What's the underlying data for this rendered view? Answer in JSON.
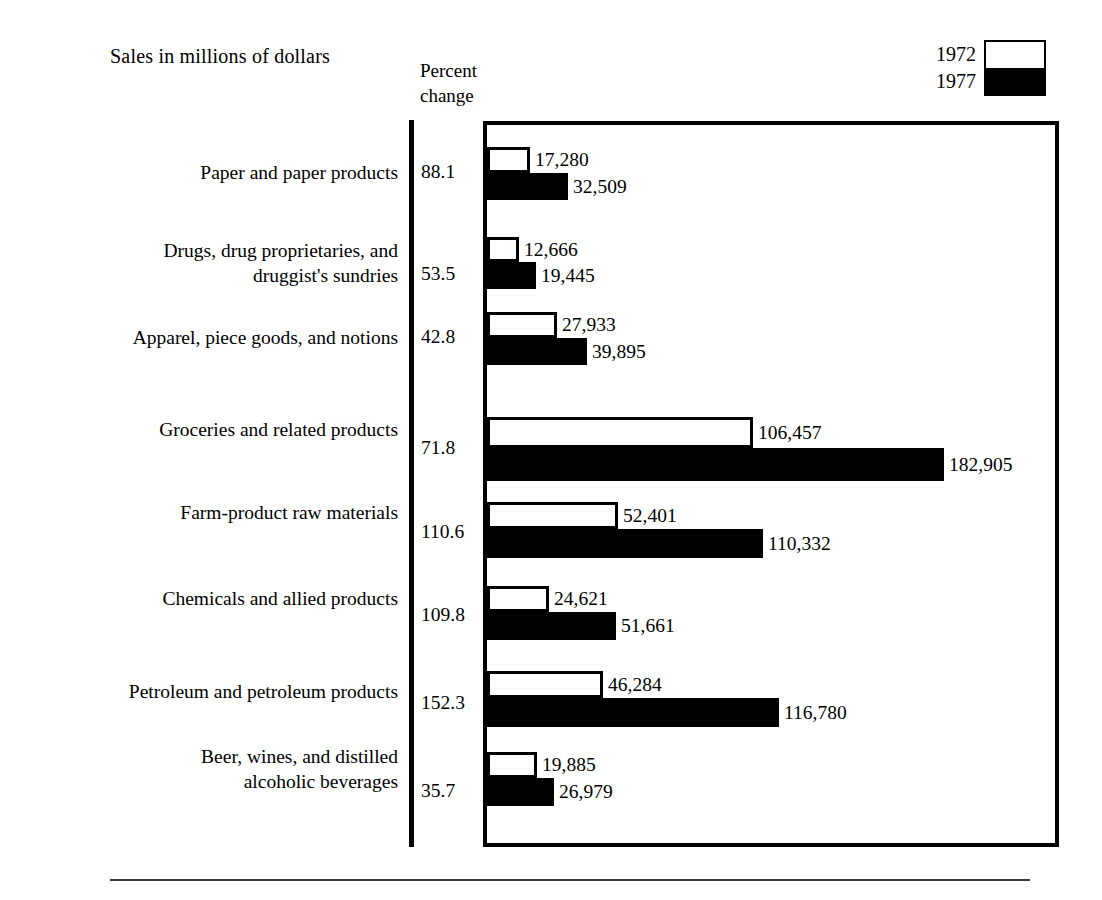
{
  "header": {
    "title": "Sales in millions of dollars",
    "percent_column_header_line1": "Percent",
    "percent_column_header_line2": "change"
  },
  "legend": {
    "position": "top-right",
    "entries": [
      {
        "label": "1972",
        "swatch": "hollow-white-rect",
        "color": "#ffffff"
      },
      {
        "label": "1977",
        "swatch": "solid-black-rect",
        "color": "#000000"
      }
    ]
  },
  "chart_data": {
    "type": "bar",
    "orientation": "horizontal",
    "title": "Sales in millions of dollars",
    "xlabel": "",
    "ylabel": "",
    "grid": false,
    "legend_position": "top-right",
    "axis_max": 182905,
    "xlim": [
      0,
      182905
    ],
    "value_unit": "millions of dollars",
    "categories": [
      "Paper and paper products",
      "Drugs, drug proprietaries, and druggist's sundries",
      "Apparel, piece goods, and notions",
      "Groceries and related products",
      "Farm-product raw materials",
      "Chemicals and allied products",
      "Petroleum and petroleum products",
      "Beer, wines, and distilled alcoholic beverages"
    ],
    "series": [
      {
        "name": "1972",
        "values": [
          17280,
          12666,
          27933,
          106457,
          52401,
          24621,
          46284,
          19885
        ]
      },
      {
        "name": "1977",
        "values": [
          32509,
          19445,
          39895,
          182905,
          110332,
          51661,
          116780,
          26979
        ]
      }
    ],
    "percent_change": [
      88.1,
      53.5,
      42.8,
      71.8,
      110.6,
      109.8,
      152.3,
      35.7
    ]
  },
  "rows": [
    {
      "label": "Paper and paper products",
      "pct": "88.1",
      "v1972": "17,280",
      "v1977": "32,509",
      "n1972": 17280,
      "n1977": 32509
    },
    {
      "label": "Drugs, drug proprietaries, and\ndruggist's sundries",
      "pct": "53.5",
      "v1972": "12,666",
      "v1977": "19,445",
      "n1972": 12666,
      "n1977": 19445
    },
    {
      "label": "Apparel, piece goods, and notions",
      "pct": "42.8",
      "v1972": "27,933",
      "v1977": "39,895",
      "n1972": 27933,
      "n1977": 39895
    },
    {
      "label": "Groceries and related products",
      "pct": "71.8",
      "v1972": "106,457",
      "v1977": "182,905",
      "n1972": 106457,
      "n1977": 182905
    },
    {
      "label": "Farm-product raw materials",
      "pct": "110.6",
      "v1972": "52,401",
      "v1977": "110,332",
      "n1972": 52401,
      "n1977": 110332
    },
    {
      "label": "Chemicals and allied products",
      "pct": "109.8",
      "v1972": "24,621",
      "v1977": "51,661",
      "n1972": 24621,
      "n1977": 51661
    },
    {
      "label": "Petroleum and petroleum products",
      "pct": "152.3",
      "v1972": "46,284",
      "v1977": "116,780",
      "n1972": 46284,
      "n1977": 116780
    },
    {
      "label": "Beer, wines, and distilled\nalcoholic beverages",
      "pct": "35.7",
      "v1972": "19,885",
      "v1977": "26,979",
      "n1972": 19885,
      "n1977": 26979
    }
  ]
}
